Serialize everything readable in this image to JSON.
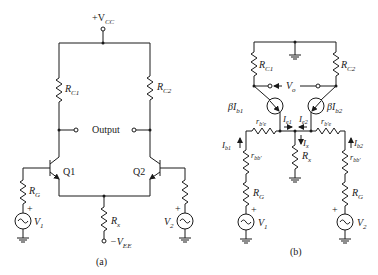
{
  "figure_a": {
    "caption": "(a)",
    "vcc_label": "+V",
    "vcc_sub": "CC",
    "rc1": {
      "main": "R",
      "sub": "C1"
    },
    "rc2": {
      "main": "R",
      "sub": "C2"
    },
    "output_label": "Output",
    "q1_label": "Q1",
    "q2_label": "Q2",
    "rg_left": {
      "main": "R",
      "sub": "G"
    },
    "rg_right": {
      "main": "R",
      "sub": "G"
    },
    "v1": {
      "main": "V",
      "sub": "1"
    },
    "v2": {
      "main": "V",
      "sub": "2"
    },
    "rx": {
      "main": "R",
      "sub": "x"
    },
    "vee_label": "−V",
    "vee_sub": "EE",
    "plus": "+"
  },
  "figure_b": {
    "caption": "(b)",
    "rc1": {
      "main": "R",
      "sub": "C1"
    },
    "rc2": {
      "main": "R",
      "sub": "C2"
    },
    "vo": {
      "main": "V",
      "sub": "o"
    },
    "src1": {
      "main": "βI",
      "sub": "b1"
    },
    "src2": {
      "main": "βI",
      "sub": "b2"
    },
    "rbe1": {
      "main": "r",
      "sub": "b′e"
    },
    "rbe2": {
      "main": "r",
      "sub": "b′e"
    },
    "ie1": {
      "main": "I",
      "sub": "e1"
    },
    "ie2": {
      "main": "I",
      "sub": "e2"
    },
    "ix": {
      "main": "I",
      "sub": "x"
    },
    "rx": {
      "main": "R",
      "sub": "x"
    },
    "ib1": {
      "main": "I",
      "sub": "b1"
    },
    "ib2": {
      "main": "I",
      "sub": "b2"
    },
    "rbb1": {
      "main": "r",
      "sub": "bb′"
    },
    "rbb2": {
      "main": "r",
      "sub": "bb′"
    },
    "rg_left": {
      "main": "R",
      "sub": "G"
    },
    "rg_right": {
      "main": "R",
      "sub": "G"
    },
    "v1": {
      "main": "V",
      "sub": "1"
    },
    "v2": {
      "main": "V",
      "sub": "2"
    },
    "plus": "+"
  }
}
